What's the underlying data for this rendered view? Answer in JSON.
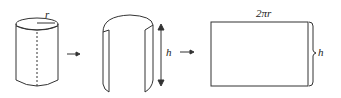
{
  "diagram": {
    "steps": [
      {
        "name": "cylinder",
        "label": "r"
      },
      {
        "name": "cut-open-cylinder",
        "label": "h"
      },
      {
        "name": "rectangle",
        "width_label": "2πr",
        "height_label": "h"
      }
    ],
    "arrows": [
      "→",
      "→"
    ],
    "colors": {
      "stroke": "#333333",
      "background": "#ffffff"
    }
  }
}
